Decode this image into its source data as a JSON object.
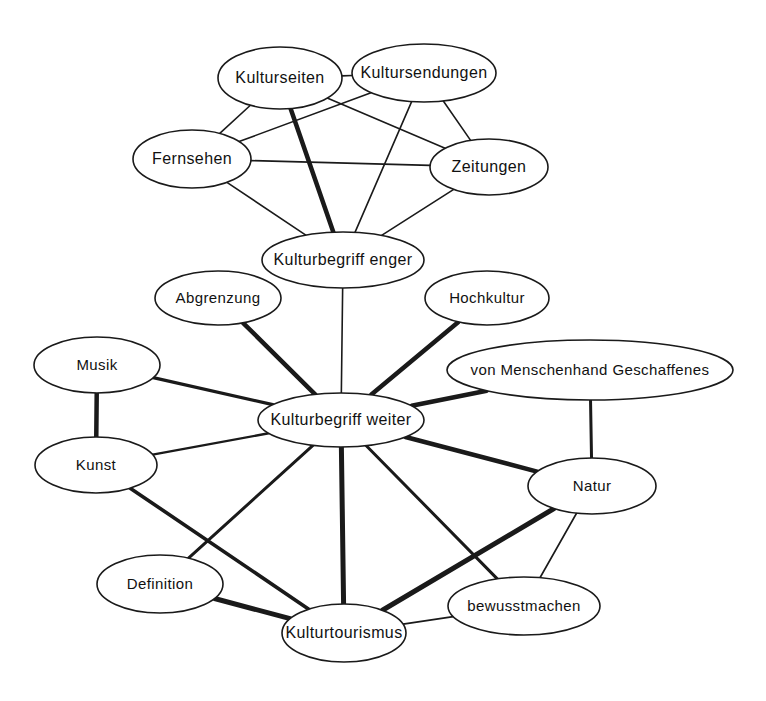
{
  "diagram": {
    "type": "node-link-network",
    "background_color": "#ffffff",
    "node_fill_color": "#ffffff",
    "node_stroke_color": "#1a1a1a",
    "edge_color": "#1a1a1a",
    "nodes": [
      {
        "id": "kulturseiten",
        "label": "Kulturseiten",
        "cx": 280,
        "cy": 78,
        "rx": 62,
        "ry": 31,
        "font_size": 16
      },
      {
        "id": "kultursendungen",
        "label": "Kultursendungen",
        "cx": 424,
        "cy": 73,
        "rx": 72,
        "ry": 29,
        "font_size": 16
      },
      {
        "id": "fernsehen",
        "label": "Fernsehen",
        "cx": 192,
        "cy": 159,
        "rx": 59,
        "ry": 29,
        "font_size": 16
      },
      {
        "id": "zeitungen",
        "label": "Zeitungen",
        "cx": 489,
        "cy": 167,
        "rx": 59,
        "ry": 28,
        "font_size": 16
      },
      {
        "id": "kulturbegriff_enger",
        "label": "Kulturbegriff enger",
        "cx": 343,
        "cy": 260,
        "rx": 81,
        "ry": 28,
        "font_size": 16
      },
      {
        "id": "abgrenzung",
        "label": "Abgrenzung",
        "cx": 218,
        "cy": 298,
        "rx": 63,
        "ry": 27,
        "font_size": 15
      },
      {
        "id": "hochkultur",
        "label": "Hochkultur",
        "cx": 487,
        "cy": 298,
        "rx": 62,
        "ry": 27,
        "font_size": 15
      },
      {
        "id": "von_menschenhand",
        "label": "von Menschenhand Geschaffenes",
        "cx": 590,
        "cy": 370,
        "rx": 143,
        "ry": 30,
        "font_size": 15
      },
      {
        "id": "musik",
        "label": "Musik",
        "cx": 97,
        "cy": 365,
        "rx": 63,
        "ry": 28,
        "font_size": 15
      },
      {
        "id": "kulturbegriff_weiter",
        "label": "Kulturbegriff weiter",
        "cx": 341,
        "cy": 420,
        "rx": 83,
        "ry": 27,
        "font_size": 16
      },
      {
        "id": "kunst",
        "label": "Kunst",
        "cx": 96,
        "cy": 465,
        "rx": 61,
        "ry": 28,
        "font_size": 15
      },
      {
        "id": "natur",
        "label": "Natur",
        "cx": 592,
        "cy": 486,
        "rx": 64,
        "ry": 28,
        "font_size": 15
      },
      {
        "id": "definition",
        "label": "Definition",
        "cx": 160,
        "cy": 584,
        "rx": 63,
        "ry": 29,
        "font_size": 15
      },
      {
        "id": "bewusstmachen",
        "label": "bewusstmachen",
        "cx": 524,
        "cy": 606,
        "rx": 76,
        "ry": 29,
        "font_size": 15
      },
      {
        "id": "kulturtourismus",
        "label": "Kulturtourismus",
        "cx": 344,
        "cy": 633,
        "rx": 62,
        "ry": 29,
        "font_size": 16
      }
    ],
    "edges": [
      {
        "source": "kulturseiten",
        "target": "kultursendungen",
        "weight": 1.6
      },
      {
        "source": "kulturseiten",
        "target": "fernsehen",
        "weight": 1.6
      },
      {
        "source": "kulturseiten",
        "target": "zeitungen",
        "weight": 1.6
      },
      {
        "source": "kulturseiten",
        "target": "kulturbegriff_enger",
        "weight": 4.5
      },
      {
        "source": "kultursendungen",
        "target": "fernsehen",
        "weight": 1.6
      },
      {
        "source": "kultursendungen",
        "target": "zeitungen",
        "weight": 1.6
      },
      {
        "source": "kultursendungen",
        "target": "kulturbegriff_enger",
        "weight": 1.6
      },
      {
        "source": "fernsehen",
        "target": "zeitungen",
        "weight": 1.6
      },
      {
        "source": "fernsehen",
        "target": "kulturbegriff_enger",
        "weight": 1.6
      },
      {
        "source": "zeitungen",
        "target": "kulturbegriff_enger",
        "weight": 1.6
      },
      {
        "source": "kulturbegriff_enger",
        "target": "kulturbegriff_weiter",
        "weight": 1.6
      },
      {
        "source": "abgrenzung",
        "target": "kulturbegriff_weiter",
        "weight": 4.5
      },
      {
        "source": "hochkultur",
        "target": "kulturbegriff_weiter",
        "weight": 4.5
      },
      {
        "source": "von_menschenhand",
        "target": "kulturbegriff_weiter",
        "weight": 4.5
      },
      {
        "source": "von_menschenhand",
        "target": "natur",
        "weight": 3.0
      },
      {
        "source": "musik",
        "target": "kunst",
        "weight": 4.5
      },
      {
        "source": "musik",
        "target": "kulturbegriff_weiter",
        "weight": 3.2
      },
      {
        "source": "kunst",
        "target": "kulturbegriff_weiter",
        "weight": 2.4
      },
      {
        "source": "kunst",
        "target": "kulturtourismus",
        "weight": 3.6
      },
      {
        "source": "kulturbegriff_weiter",
        "target": "definition",
        "weight": 3.0
      },
      {
        "source": "kulturbegriff_weiter",
        "target": "kulturtourismus",
        "weight": 5.0
      },
      {
        "source": "kulturbegriff_weiter",
        "target": "natur",
        "weight": 4.5
      },
      {
        "source": "kulturbegriff_weiter",
        "target": "bewusstmachen",
        "weight": 3.0
      },
      {
        "source": "definition",
        "target": "kulturtourismus",
        "weight": 5.0
      },
      {
        "source": "natur",
        "target": "kulturtourismus",
        "weight": 5.0
      },
      {
        "source": "natur",
        "target": "bewusstmachen",
        "weight": 1.8
      },
      {
        "source": "bewusstmachen",
        "target": "kulturtourismus",
        "weight": 1.8
      }
    ]
  }
}
